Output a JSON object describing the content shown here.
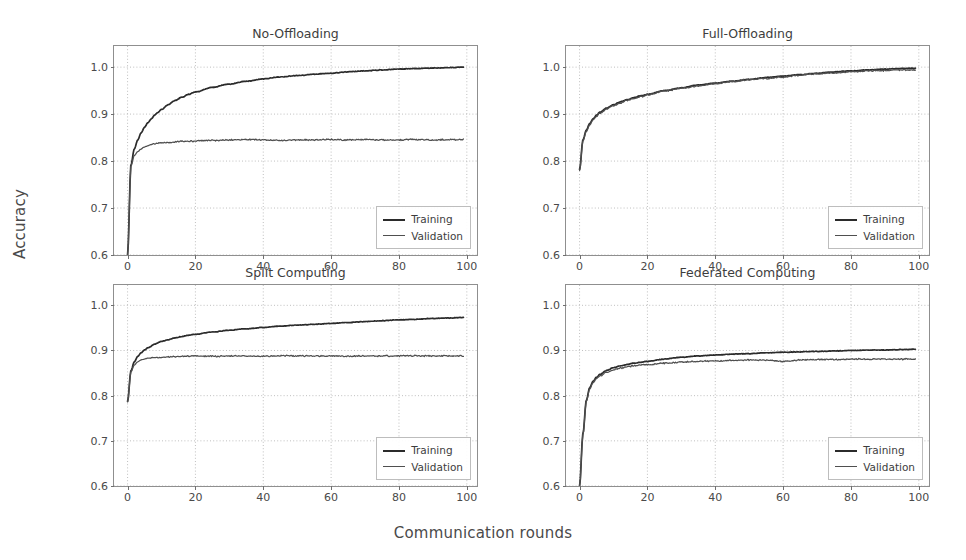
{
  "figure": {
    "xlabel": "Communication rounds",
    "ylabel": "Accuracy",
    "background": "#ffffff",
    "axis_color": "#8f8f8f",
    "grid_color": "#b8b8b8"
  },
  "legend": {
    "training_label": "Training",
    "validation_label": "Validation",
    "training_color": "#2b2b2b",
    "validation_color": "#4f4f4f"
  },
  "chart_data": [
    {
      "type": "line",
      "title": "No-Offloading",
      "xlabel": "Communication rounds",
      "ylabel": "Accuracy",
      "xlim": [
        -4,
        103
      ],
      "ylim": [
        0.6,
        1.045
      ],
      "xticks": [
        0,
        20,
        40,
        60,
        80,
        100
      ],
      "yticks": [
        0.6,
        0.7,
        0.8,
        0.9,
        1.0
      ],
      "ytick_labels": [
        "0.6",
        "0.7",
        "0.8",
        "0.9",
        "1.0"
      ],
      "xtick_labels": [
        "0",
        "20",
        "40",
        "60",
        "80",
        "100"
      ],
      "grid": true,
      "legend_position": "lower right",
      "x": [
        0,
        1,
        2,
        3,
        4,
        5,
        6,
        7,
        8,
        9,
        10,
        12,
        14,
        16,
        18,
        20,
        25,
        30,
        35,
        40,
        45,
        50,
        55,
        60,
        65,
        70,
        75,
        80,
        85,
        90,
        95,
        99
      ],
      "series": [
        {
          "name": "Training",
          "values": [
            0.6,
            0.792,
            0.826,
            0.845,
            0.86,
            0.872,
            0.882,
            0.89,
            0.898,
            0.904,
            0.91,
            0.92,
            0.929,
            0.936,
            0.942,
            0.947,
            0.957,
            0.964,
            0.97,
            0.975,
            0.979,
            0.982,
            0.985,
            0.987,
            0.99,
            0.992,
            0.994,
            0.996,
            0.997,
            0.998,
            0.999,
            1.0
          ]
        },
        {
          "name": "Validation",
          "values": [
            0.6,
            0.79,
            0.812,
            0.82,
            0.826,
            0.83,
            0.833,
            0.835,
            0.837,
            0.838,
            0.839,
            0.84,
            0.841,
            0.842,
            0.842,
            0.843,
            0.844,
            0.845,
            0.846,
            0.845,
            0.844,
            0.845,
            0.845,
            0.846,
            0.845,
            0.846,
            0.845,
            0.845,
            0.846,
            0.845,
            0.846,
            0.846
          ]
        }
      ]
    },
    {
      "type": "line",
      "title": "Full-Offloading",
      "xlabel": "Communication rounds",
      "ylabel": "Accuracy",
      "xlim": [
        -4,
        103
      ],
      "ylim": [
        0.6,
        1.045
      ],
      "xticks": [
        0,
        20,
        40,
        60,
        80,
        100
      ],
      "yticks": [
        0.6,
        0.7,
        0.8,
        0.9,
        1.0
      ],
      "ytick_labels": [
        "0.6",
        "0.7",
        "0.8",
        "0.9",
        "1.0"
      ],
      "xtick_labels": [
        "0",
        "20",
        "40",
        "60",
        "80",
        "100"
      ],
      "grid": true,
      "legend_position": "lower right",
      "x": [
        0,
        1,
        2,
        3,
        4,
        5,
        6,
        8,
        10,
        12,
        14,
        16,
        18,
        20,
        25,
        30,
        35,
        40,
        45,
        50,
        55,
        60,
        65,
        70,
        75,
        80,
        85,
        90,
        95,
        99
      ],
      "series": [
        {
          "name": "Training",
          "values": [
            0.782,
            0.845,
            0.866,
            0.88,
            0.89,
            0.898,
            0.904,
            0.913,
            0.92,
            0.926,
            0.931,
            0.935,
            0.939,
            0.942,
            0.95,
            0.956,
            0.962,
            0.966,
            0.97,
            0.974,
            0.978,
            0.981,
            0.984,
            0.987,
            0.99,
            0.992,
            0.994,
            0.996,
            0.997,
            0.998
          ]
        },
        {
          "name": "Validation",
          "values": [
            0.78,
            0.843,
            0.863,
            0.877,
            0.888,
            0.895,
            0.902,
            0.911,
            0.918,
            0.924,
            0.929,
            0.933,
            0.937,
            0.941,
            0.949,
            0.955,
            0.96,
            0.965,
            0.969,
            0.973,
            0.976,
            0.979,
            0.983,
            0.986,
            0.988,
            0.99,
            0.992,
            0.993,
            0.994,
            0.994
          ]
        }
      ]
    },
    {
      "type": "line",
      "title": "Split Computing",
      "xlabel": "Communication rounds",
      "ylabel": "Accuracy",
      "xlim": [
        -4,
        103
      ],
      "ylim": [
        0.6,
        1.045
      ],
      "xticks": [
        0,
        20,
        40,
        60,
        80,
        100
      ],
      "yticks": [
        0.6,
        0.7,
        0.8,
        0.9,
        1.0
      ],
      "ytick_labels": [
        "0.6",
        "0.7",
        "0.8",
        "0.9",
        "1.0"
      ],
      "xtick_labels": [
        "0",
        "20",
        "40",
        "60",
        "80",
        "100"
      ],
      "grid": true,
      "legend_position": "lower right",
      "x": [
        0,
        1,
        2,
        3,
        4,
        5,
        6,
        8,
        10,
        12,
        14,
        16,
        18,
        20,
        25,
        30,
        35,
        40,
        45,
        50,
        55,
        60,
        65,
        70,
        75,
        80,
        85,
        90,
        95,
        99
      ],
      "series": [
        {
          "name": "Training",
          "values": [
            0.787,
            0.855,
            0.875,
            0.887,
            0.895,
            0.901,
            0.906,
            0.914,
            0.92,
            0.924,
            0.928,
            0.931,
            0.934,
            0.936,
            0.941,
            0.945,
            0.948,
            0.951,
            0.954,
            0.956,
            0.958,
            0.96,
            0.962,
            0.964,
            0.966,
            0.968,
            0.969,
            0.971,
            0.972,
            0.973
          ]
        },
        {
          "name": "Validation",
          "values": [
            0.787,
            0.853,
            0.868,
            0.875,
            0.879,
            0.881,
            0.883,
            0.884,
            0.885,
            0.886,
            0.886,
            0.887,
            0.887,
            0.888,
            0.887,
            0.888,
            0.888,
            0.887,
            0.888,
            0.888,
            0.888,
            0.888,
            0.887,
            0.888,
            0.888,
            0.888,
            0.888,
            0.888,
            0.888,
            0.888
          ]
        }
      ]
    },
    {
      "type": "line",
      "title": "Federated Computing",
      "xlabel": "Communication rounds",
      "ylabel": "Accuracy",
      "xlim": [
        -4,
        103
      ],
      "ylim": [
        0.6,
        1.045
      ],
      "xticks": [
        0,
        20,
        40,
        60,
        80,
        100
      ],
      "yticks": [
        0.6,
        0.7,
        0.8,
        0.9,
        1.0
      ],
      "ytick_labels": [
        "0.6",
        "0.7",
        "0.8",
        "0.9",
        "1.0"
      ],
      "xtick_labels": [
        "0",
        "20",
        "40",
        "60",
        "80",
        "100"
      ],
      "grid": true,
      "legend_position": "lower right",
      "x": [
        0,
        1,
        2,
        3,
        4,
        5,
        6,
        8,
        10,
        12,
        14,
        16,
        18,
        20,
        25,
        30,
        35,
        40,
        45,
        50,
        55,
        60,
        65,
        70,
        75,
        80,
        85,
        90,
        95,
        99
      ],
      "series": [
        {
          "name": "Training",
          "values": [
            0.6,
            0.716,
            0.79,
            0.818,
            0.832,
            0.841,
            0.847,
            0.856,
            0.862,
            0.866,
            0.869,
            0.872,
            0.874,
            0.876,
            0.881,
            0.885,
            0.888,
            0.89,
            0.892,
            0.893,
            0.895,
            0.896,
            0.897,
            0.898,
            0.899,
            0.9,
            0.901,
            0.901,
            0.902,
            0.903
          ]
        },
        {
          "name": "Validation",
          "values": [
            0.6,
            0.714,
            0.788,
            0.815,
            0.829,
            0.838,
            0.844,
            0.852,
            0.857,
            0.861,
            0.864,
            0.866,
            0.868,
            0.869,
            0.872,
            0.874,
            0.876,
            0.877,
            0.878,
            0.879,
            0.879,
            0.876,
            0.879,
            0.88,
            0.88,
            0.881,
            0.881,
            0.881,
            0.881,
            0.881
          ]
        }
      ]
    }
  ]
}
